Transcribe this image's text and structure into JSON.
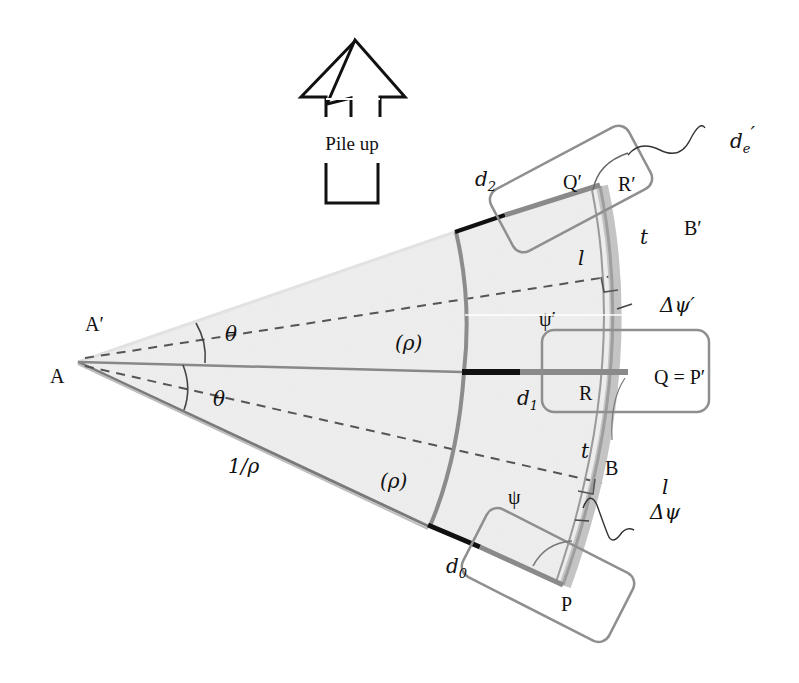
{
  "figure": {
    "type": "geometric diagram",
    "arrow": {
      "label": "Pile up",
      "direction": "up"
    },
    "points": {
      "A": "A",
      "A_prime": "A′",
      "B": "B",
      "B_prime": "B′",
      "P": "P",
      "Q_prime": "Q′",
      "R": "R",
      "R_prime": "R′",
      "Q_eq_P_prime": "Q = P′"
    },
    "angles": {
      "theta_upper": "θ",
      "theta_lower": "θ",
      "psi": "ψ",
      "psi_prime": "ψ′",
      "delta_psi": "Δψ",
      "delta_psi_prime": "Δψ′"
    },
    "lengths": {
      "radius": "1/ρ",
      "rho_upper": "(ρ)",
      "rho_lower": "(ρ)",
      "t_upper": "t",
      "t_lower": "t",
      "l_upper": "l",
      "l_lower": "l",
      "d0": {
        "base": "d",
        "sub": "0"
      },
      "d1": {
        "base": "d",
        "sub": "1"
      },
      "d2": {
        "base": "d",
        "sub": "2"
      },
      "de_prime": {
        "base": "d",
        "sub": "e",
        "prime": "′"
      }
    },
    "colors": {
      "wedge_fill": "#ececec",
      "gray_stroke": "#8a8a8a",
      "black_stroke": "#111111",
      "arc_band": "#b5b5b5"
    }
  }
}
